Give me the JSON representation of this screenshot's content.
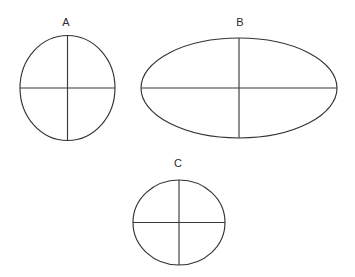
{
  "figure": {
    "background_color": "#ffffff",
    "stroke_color": "#333333",
    "label_color": "#2b2b2b",
    "width": 355,
    "height": 277
  },
  "shapes": [
    {
      "id": "shape-a",
      "label": "A",
      "kind": "circle",
      "cx": 67.5,
      "cy": 88,
      "rx": 47.5,
      "ry": 52.5,
      "label_x": 66,
      "label_y": 23,
      "has_vertical_axis": true,
      "has_horizontal_axis": true
    },
    {
      "id": "shape-b",
      "label": "B",
      "kind": "ellipse",
      "cx": 239,
      "cy": 88,
      "rx": 98,
      "ry": 50,
      "label_x": 240,
      "label_y": 23,
      "has_vertical_axis": true,
      "has_horizontal_axis": true
    },
    {
      "id": "shape-c",
      "label": "C",
      "kind": "ellipse",
      "cx": 179,
      "cy": 222.5,
      "rx": 46,
      "ry": 42.5,
      "label_x": 178,
      "label_y": 164,
      "has_vertical_axis": true,
      "has_horizontal_axis": true
    }
  ]
}
